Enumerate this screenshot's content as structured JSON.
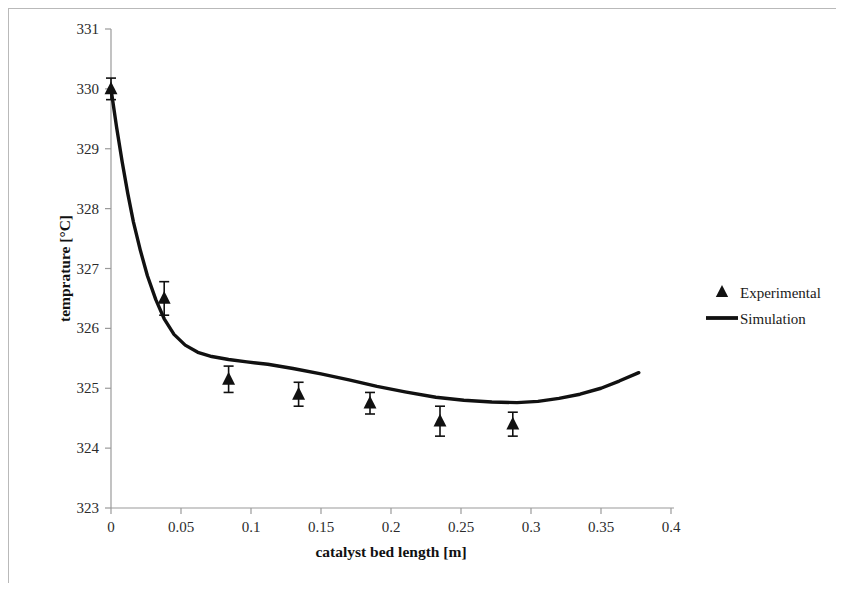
{
  "chart_data": {
    "type": "line",
    "title": "",
    "xlabel": "catalyst bed length [m]",
    "ylabel": "temprature [°C]",
    "xlim": [
      0,
      0.4
    ],
    "ylim": [
      323,
      331
    ],
    "xticks": [
      "0",
      "0.05",
      "0.1",
      "0.15",
      "0.2",
      "0.25",
      "0.3",
      "0.35",
      "0.4"
    ],
    "xtick_values": [
      0,
      0.05,
      0.1,
      0.15,
      0.2,
      0.25,
      0.3,
      0.35,
      0.4
    ],
    "yticks": [
      "323",
      "324",
      "325",
      "326",
      "327",
      "328",
      "329",
      "330",
      "331"
    ],
    "ytick_values": [
      323,
      324,
      325,
      326,
      327,
      328,
      329,
      330,
      331
    ],
    "grid": false,
    "legend_position": "right",
    "series": [
      {
        "name": "Experimental",
        "type": "scatter",
        "marker": "triangle",
        "color": "#111111",
        "x": [
          0.0,
          0.038,
          0.084,
          0.134,
          0.185,
          0.235,
          0.287
        ],
        "y": [
          330.0,
          326.5,
          325.15,
          324.9,
          324.75,
          324.45,
          324.4
        ],
        "yerr": [
          0.18,
          0.28,
          0.22,
          0.2,
          0.18,
          0.25,
          0.2
        ]
      },
      {
        "name": "Simulation",
        "type": "line",
        "color": "#111111",
        "x": [
          0.0,
          0.004,
          0.008,
          0.012,
          0.016,
          0.021,
          0.026,
          0.032,
          0.038,
          0.045,
          0.053,
          0.062,
          0.072,
          0.084,
          0.097,
          0.112,
          0.13,
          0.15,
          0.17,
          0.19,
          0.21,
          0.232,
          0.252,
          0.272,
          0.29,
          0.305,
          0.32,
          0.335,
          0.35,
          0.363,
          0.377
        ],
        "y": [
          330.0,
          329.36,
          328.78,
          328.25,
          327.78,
          327.3,
          326.88,
          326.48,
          326.16,
          325.9,
          325.72,
          325.6,
          325.53,
          325.48,
          325.44,
          325.4,
          325.33,
          325.24,
          325.14,
          325.03,
          324.94,
          324.85,
          324.8,
          324.77,
          324.76,
          324.78,
          324.83,
          324.9,
          325.0,
          325.12,
          325.26
        ]
      }
    ],
    "legend": [
      {
        "label": "Experimental",
        "marker": "triangle"
      },
      {
        "label": "Simulation",
        "marker": "line"
      }
    ]
  }
}
